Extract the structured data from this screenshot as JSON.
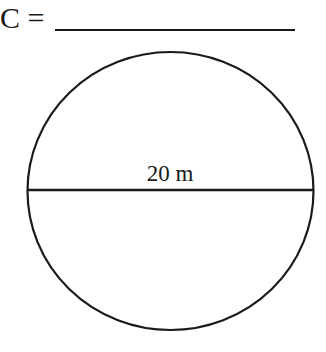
{
  "prompt": {
    "label": "C ="
  },
  "figure": {
    "shape": "circle",
    "diameter_label": "20 m",
    "stroke_color": "#1a1a1a"
  }
}
